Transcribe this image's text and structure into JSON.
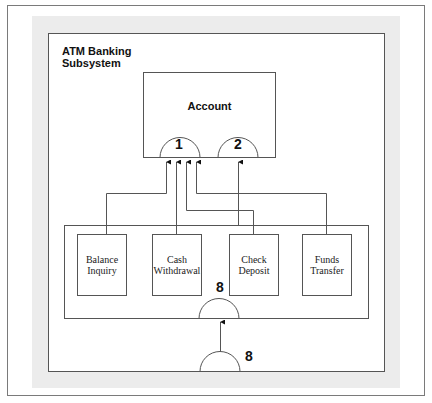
{
  "diagram": {
    "subsystem": {
      "title": "ATM Banking\nSubsystem"
    },
    "account": {
      "label": "Account",
      "ports": [
        {
          "id": "1",
          "label": "1"
        },
        {
          "id": "2",
          "label": "2"
        }
      ]
    },
    "components": [
      {
        "id": "balance-inquiry",
        "label": "Balance\nInquiry"
      },
      {
        "id": "cash-withdrawal",
        "label": "Cash\nWithdrawal"
      },
      {
        "id": "check-deposit",
        "label": "Check\nDeposit"
      },
      {
        "id": "funds-transfer",
        "label": "Funds\nTransfer"
      }
    ],
    "container_port": {
      "label": "8"
    },
    "subsystem_port": {
      "label": "8"
    },
    "connections": [
      {
        "from": "Balance Inquiry",
        "to": "Account port 1"
      },
      {
        "from": "Cash Withdrawal",
        "to": "Account port 1"
      },
      {
        "from": "Check Deposit",
        "to": "Account port 1"
      },
      {
        "from": "Funds Transfer",
        "to": "Account port 1"
      },
      {
        "from": "Check Deposit",
        "to": "Account port 2"
      },
      {
        "from": "Subsystem port 8",
        "to": "Container port 8"
      }
    ],
    "colors": {
      "line": "#555555",
      "band": "#ececec",
      "frame": "#7a7a7a"
    }
  }
}
